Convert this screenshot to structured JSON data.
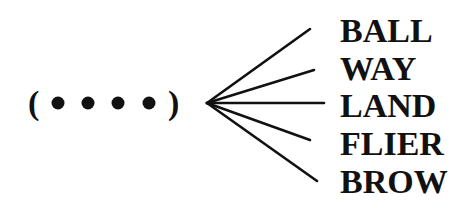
{
  "diagram": {
    "type": "word-fan",
    "pattern": {
      "open_paren": "(",
      "close_paren": ")",
      "dot_count": 4,
      "dot_glyph": "•",
      "dots": [
        {
          "cx": 58,
          "cy": 103
        },
        {
          "cx": 88,
          "cy": 103
        },
        {
          "cx": 118,
          "cy": 103
        },
        {
          "cx": 149,
          "cy": 103
        }
      ]
    },
    "apex": {
      "x": 207,
      "y": 103
    },
    "branches": [
      {
        "word": "BALL",
        "end": {
          "x": 310,
          "y": 29
        },
        "text_x": 341,
        "text_y": 42
      },
      {
        "word": "WAY",
        "end": {
          "x": 314,
          "y": 70
        },
        "text_x": 341,
        "text_y": 80
      },
      {
        "word": "LAND",
        "end": {
          "x": 324,
          "y": 103
        },
        "text_x": 341,
        "text_y": 117
      },
      {
        "word": "FLIER",
        "end": {
          "x": 310,
          "y": 140
        },
        "text_x": 341,
        "text_y": 155
      },
      {
        "word": "BROW",
        "end": {
          "x": 317,
          "y": 181
        },
        "text_x": 341,
        "text_y": 193
      }
    ],
    "colors": {
      "ink": "#111111",
      "background": "#ffffff"
    }
  }
}
